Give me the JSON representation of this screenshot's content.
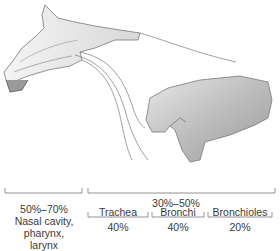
{
  "figure": {
    "upper_airway": {
      "range": "50%–70%",
      "label_lines": [
        "Nasal cavity,",
        "pharynx,",
        "larynx"
      ]
    },
    "lower_airway": {
      "range": "30%–50%",
      "segments": [
        {
          "name": "Trachea",
          "value": "40%"
        },
        {
          "name": "Bronchi",
          "value": "40%"
        },
        {
          "name": "Bronchioles",
          "value": "20%"
        }
      ]
    }
  }
}
